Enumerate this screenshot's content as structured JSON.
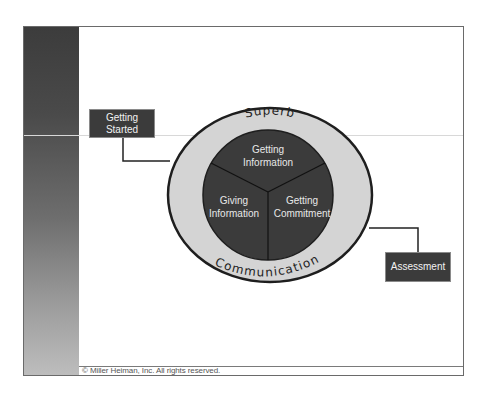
{
  "slide": {
    "footer": "© Miller Heiman, Inc. All rights reserved."
  },
  "diagram": {
    "outer_ring": {
      "top_label": "Superb",
      "bottom_label": "Communication"
    },
    "segments": [
      {
        "id": "top",
        "line1": "Getting",
        "line2": "Information"
      },
      {
        "id": "left",
        "line1": "Giving",
        "line2": "Information"
      },
      {
        "id": "right",
        "line1": "Getting",
        "line2": "Commitment"
      }
    ],
    "start_box": {
      "line1": "Getting",
      "line2": "Started"
    },
    "end_box": {
      "label": "Assessment"
    }
  },
  "colors": {
    "dark_fill": "#3b3b3b",
    "ring_fill": "#d4d4d4",
    "outline": "#1e1e1e",
    "text_light": "#f2f2f2"
  }
}
